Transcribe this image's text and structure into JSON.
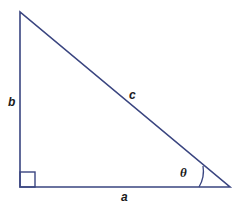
{
  "diagram": {
    "type": "right-triangle",
    "stroke_color": "#3a4580",
    "vertices": {
      "top": [
        20,
        12
      ],
      "right_angle": [
        20,
        187
      ],
      "acute": [
        230,
        187
      ]
    },
    "labels": {
      "vertical_side": "b",
      "hypotenuse": "c",
      "horizontal_side": "a",
      "angle": "θ"
    },
    "right_angle_marker": true
  }
}
